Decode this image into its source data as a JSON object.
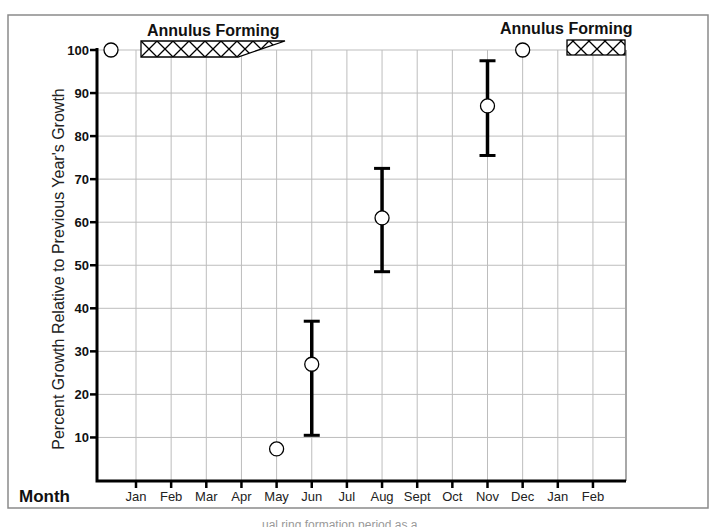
{
  "chart_data": {
    "type": "scatter",
    "title": "",
    "xlabel": "Month",
    "ylabel": "Percent Growth Relative to Previous Year's Growth",
    "ylim": [
      0,
      100
    ],
    "yticks": [
      10,
      20,
      30,
      40,
      50,
      60,
      70,
      80,
      90,
      100
    ],
    "categories": [
      "Jan",
      "Feb",
      "Mar",
      "Apr",
      "May",
      "Jun",
      "Jul",
      "Aug",
      "Sept",
      "Oct",
      "Nov",
      "Dec",
      "Jan",
      "Feb"
    ],
    "grid": true,
    "legend": null,
    "series": [
      {
        "name": "Percent growth (mean with range)",
        "points": [
          {
            "x": "Dec (prior)",
            "x_index": -1,
            "y": 100,
            "low": null,
            "high": null
          },
          {
            "x": "May",
            "x_index": 4,
            "y": 8.5,
            "low": null,
            "high": null
          },
          {
            "x": "Jun",
            "x_index": 5,
            "y": 27,
            "low": 10.5,
            "high": 37
          },
          {
            "x": "Aug",
            "x_index": 7,
            "y": 61,
            "low": 48.5,
            "high": 72.5
          },
          {
            "x": "Nov",
            "x_index": 10,
            "y": 87,
            "low": 75.5,
            "high": 97.5
          },
          {
            "x": "Dec",
            "x_index": 11,
            "y": 100,
            "low": null,
            "high": null
          }
        ]
      }
    ],
    "annotations": [
      {
        "text": "Annulus Forming",
        "period_start": "Jan",
        "period_end": "Apr/May (tapering)",
        "style": "cross-hatched band"
      },
      {
        "text": "Annulus Forming",
        "period_start": "Jan",
        "period_end": "Feb",
        "style": "cross-hatched band"
      }
    ]
  },
  "labels": {
    "annulus_left": "Annulus Forming",
    "annulus_right": "Annulus Forming",
    "x_axis_title": "Month",
    "y_axis_title": "Percent Growth Relative to Previous Year's Growth"
  },
  "caption_partial": "…ual ring formation period as a"
}
